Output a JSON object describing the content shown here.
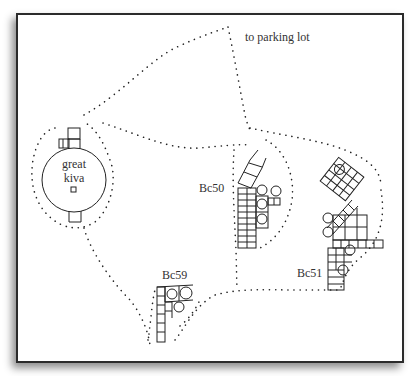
{
  "figure": {
    "type": "archaeological site map",
    "labels": {
      "parking": "to parking lot",
      "great_kiva_line1": "great",
      "great_kiva_line2": "kiva",
      "bc50": "Bc50",
      "bc51": "Bc51",
      "bc59": "Bc59"
    },
    "colors": {
      "ink": "#222222",
      "frame": "#2b2b2b",
      "background": "#ffffff"
    }
  }
}
